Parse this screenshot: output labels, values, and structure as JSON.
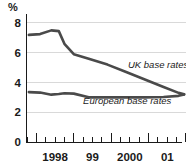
{
  "chart_data": {
    "type": "line",
    "title": "",
    "subtitle": "",
    "xlabel": "",
    "ylabel": "%",
    "y_unit_label": "%",
    "ylim": [
      0,
      8.6
    ],
    "yticks": [
      0,
      2,
      4,
      6,
      8
    ],
    "ytick_labels": [
      "0",
      "2",
      "4",
      "6",
      "8"
    ],
    "grid": true,
    "gridlines_at": [
      2,
      4,
      6,
      8
    ],
    "legend_position": "inline-annotation",
    "xlim": [
      1997.75,
      2002.0
    ],
    "xtick_labels": [
      "1998",
      "99",
      "2000",
      "01"
    ],
    "xtick_label_positions": [
      1998.5,
      1999.5,
      2000.5,
      2001.5
    ],
    "x_major_ticks": [
      1998.0,
      1999.0,
      2000.0,
      2001.0,
      2002.0
    ],
    "x_minor_ticks": [
      1997.75,
      1998.25,
      1998.5,
      1998.75,
      1999.25,
      1999.5,
      1999.75,
      2000.25,
      2000.5,
      2000.75,
      2001.25,
      2001.5,
      2001.75
    ],
    "x": [
      1997.8,
      1998.1,
      1998.4,
      1998.6,
      1998.75,
      1999.0,
      1999.4,
      1999.9,
      2000.4,
      2000.9,
      2001.4,
      2001.8,
      2001.95
    ],
    "series": [
      {
        "name": "UK base rates",
        "color": "#4a4a4a",
        "label_x": 2000.45,
        "label_y": 4.95,
        "values": [
          7.2,
          7.25,
          7.5,
          7.45,
          6.6,
          5.9,
          5.6,
          5.2,
          4.7,
          4.2,
          3.7,
          3.3,
          3.2
        ]
      },
      {
        "name": "European base rates",
        "color": "#4a4a4a",
        "label_x": 1999.25,
        "label_y": 2.52,
        "values": [
          3.35,
          3.32,
          3.18,
          3.22,
          3.28,
          3.25,
          3.0,
          3.0,
          3.0,
          3.0,
          3.02,
          3.1,
          3.2
        ]
      }
    ],
    "annotations": [
      {
        "text": "UK base rates",
        "x": 2000.45,
        "y": 4.95
      },
      {
        "text": "European base rates",
        "x": 1999.25,
        "y": 2.52
      }
    ]
  },
  "colors": {
    "line": "#4a4a4a",
    "axis": "#1a1a1a",
    "grid": "#d9d9d9",
    "background": "#ffffff",
    "text": "#1a1a1a"
  }
}
